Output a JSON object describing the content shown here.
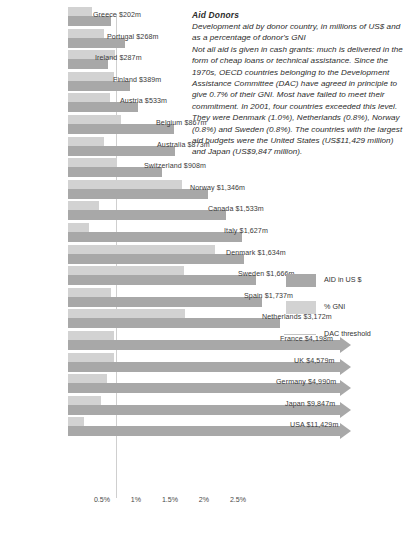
{
  "panel": {
    "title": "Aid Donors",
    "paragraph1": "Development aid by donor country, in millions of US$ and as a percentage of donor's GNI",
    "paragraph2": "Not all aid is given in cash grants: much is delivered in the form of cheap loans or technical assistance. Since the 1970s, OECD countries belonging to the Development Assistance Committee (DAC) have agreed in principle to give 0.7% of their GNI. Most have failed to meet their commitment. In 2001, four countries exceeded this level. They were Denmark (1.0%), Netherlands (0.8%), Norway (0.8%) and Sweden (0.8%). The countries with the largest aid budgets were the United States (US$11,429 million) and Japan (US$9,847 million)."
  },
  "legend": {
    "items": [
      {
        "label": "AID in US $",
        "type": "swatch",
        "color": "#a8a8a8"
      },
      {
        "label": "% GNI",
        "type": "swatch",
        "color": "#d2d2d2"
      },
      {
        "label": "DAC threshold",
        "type": "line",
        "color": "#c3c3c3"
      }
    ]
  },
  "chart_data": {
    "type": "bar",
    "title": "Aid Donors",
    "orientation": "horizontal",
    "xlabel": "",
    "ylabel": "",
    "grid": false,
    "legend_position": "right",
    "axis_ticks": [
      "0.5%",
      "1%",
      "1.5%",
      "2%",
      "2.5%"
    ],
    "axis_tick_values": [
      0.5,
      1.0,
      1.5,
      2.0,
      2.5
    ],
    "xlim_percent": [
      0,
      3.0
    ],
    "dac_threshold_percent": 0.7,
    "categories": [
      "Greece",
      "Portugal",
      "Ireland",
      "Finland",
      "Austria",
      "Belgium",
      "Australia",
      "Switzerland",
      "Norway",
      "Canada",
      "Italy",
      "Denmark",
      "Sweden",
      "Spain",
      "Netherlands",
      "France",
      "UK",
      "Germany",
      "Japan",
      "USA"
    ],
    "labels": [
      "Greece $202m",
      "Portugal $268m",
      "Ireland $287m",
      "Finland $389m",
      "Austria $533m",
      "Belgium $867m",
      "Australia $873m",
      "Switzerland $908m",
      "Norway $1,346m",
      "Canada $1,533m",
      "Italy $1,627m",
      "Denmark $1,634m",
      "Sweden $1,666m",
      "Spain $1,737m",
      "Netherlands $3,172m",
      "France $4,198m",
      "UK $4,579m",
      "Germany $4,990m",
      "Japan $9,847m",
      "USA $11,429m"
    ],
    "series": [
      {
        "name": "AID in US $",
        "unit": "US$ millions",
        "color": "#a8a8a8",
        "values": [
          202,
          268,
          287,
          389,
          533,
          867,
          873,
          908,
          1346,
          1533,
          1627,
          1634,
          1666,
          1737,
          3172,
          4198,
          4579,
          4990,
          9847,
          11429
        ]
      },
      {
        "name": "% GNI",
        "unit": "percent of GNI",
        "color": "#d2d2d2",
        "values": [
          0.17,
          0.25,
          0.33,
          0.32,
          0.29,
          0.37,
          0.25,
          0.34,
          0.8,
          0.22,
          0.15,
          1.03,
          0.81,
          0.3,
          0.82,
          0.32,
          0.32,
          0.27,
          0.23,
          0.11
        ]
      }
    ],
    "rows": [
      {
        "label": "Greece $202m",
        "aid": 202,
        "gni": 0.17,
        "aid_px": 43,
        "gni_px": 24,
        "label_x": 93,
        "arrow": false
      },
      {
        "label": "Portugal $268m",
        "aid": 268,
        "gni": 0.25,
        "aid_px": 57,
        "gni_px": 36,
        "label_x": 107,
        "arrow": false
      },
      {
        "label": "Ireland $287m",
        "aid": 287,
        "gni": 0.33,
        "aid_px": 40,
        "gni_px": 47,
        "label_x": 95,
        "arrow": false
      },
      {
        "label": "Finland $389m",
        "aid": 389,
        "gni": 0.32,
        "aid_px": 62,
        "gni_px": 46,
        "label_x": 113,
        "arrow": false
      },
      {
        "label": "Austria $533m",
        "aid": 533,
        "gni": 0.29,
        "aid_px": 70,
        "gni_px": 42,
        "label_x": 120,
        "arrow": false
      },
      {
        "label": "Belgium $867m",
        "aid": 867,
        "gni": 0.37,
        "aid_px": 106,
        "gni_px": 53,
        "label_x": 156,
        "arrow": false
      },
      {
        "label": "Australia $873m",
        "aid": 873,
        "gni": 0.25,
        "aid_px": 107,
        "gni_px": 36,
        "label_x": 157,
        "arrow": false
      },
      {
        "label": "Switzerland $908m",
        "aid": 908,
        "gni": 0.34,
        "aid_px": 94,
        "gni_px": 49,
        "label_x": 144,
        "arrow": false
      },
      {
        "label": "Norway $1,346m",
        "aid": 1346,
        "gni": 0.8,
        "aid_px": 140,
        "gni_px": 114,
        "label_x": 190,
        "arrow": false
      },
      {
        "label": "Canada $1,533m",
        "aid": 1533,
        "gni": 0.22,
        "aid_px": 158,
        "gni_px": 31,
        "label_x": 208,
        "arrow": false
      },
      {
        "label": "Italy $1,627m",
        "aid": 1627,
        "gni": 0.15,
        "aid_px": 174,
        "gni_px": 21,
        "label_x": 224,
        "arrow": false
      },
      {
        "label": "Denmark $1,634m",
        "aid": 1634,
        "gni": 1.03,
        "aid_px": 176,
        "gni_px": 147,
        "label_x": 226,
        "arrow": false
      },
      {
        "label": "Sweden $1,666m",
        "aid": 1666,
        "gni": 0.81,
        "aid_px": 188,
        "gni_px": 116,
        "label_x": 238,
        "arrow": false
      },
      {
        "label": "Spain $1,737m",
        "aid": 1737,
        "gni": 0.3,
        "aid_px": 194,
        "gni_px": 43,
        "label_x": 244,
        "arrow": false
      },
      {
        "label": "Netherlands $3,172m",
        "aid": 3172,
        "gni": 0.82,
        "aid_px": 212,
        "gni_px": 117,
        "label_x": 262,
        "arrow": false
      },
      {
        "label": "France $4,198m",
        "aid": 4198,
        "gni": 0.32,
        "aid_px": 272,
        "gni_px": 46,
        "label_x": 280,
        "arrow": true
      },
      {
        "label": "UK $4,579m",
        "aid": 4579,
        "gni": 0.32,
        "aid_px": 272,
        "gni_px": 46,
        "label_x": 294,
        "arrow": true
      },
      {
        "label": "Germany $4,990m",
        "aid": 4990,
        "gni": 0.27,
        "aid_px": 272,
        "gni_px": 39,
        "label_x": 276,
        "arrow": true
      },
      {
        "label": "Japan $9,847m",
        "aid": 9847,
        "gni": 0.23,
        "aid_px": 272,
        "gni_px": 33,
        "label_x": 285,
        "arrow": true
      },
      {
        "label": "USA $11,429m",
        "aid": 11429,
        "gni": 0.11,
        "aid_px": 272,
        "gni_px": 16,
        "label_x": 290,
        "arrow": true
      }
    ]
  }
}
